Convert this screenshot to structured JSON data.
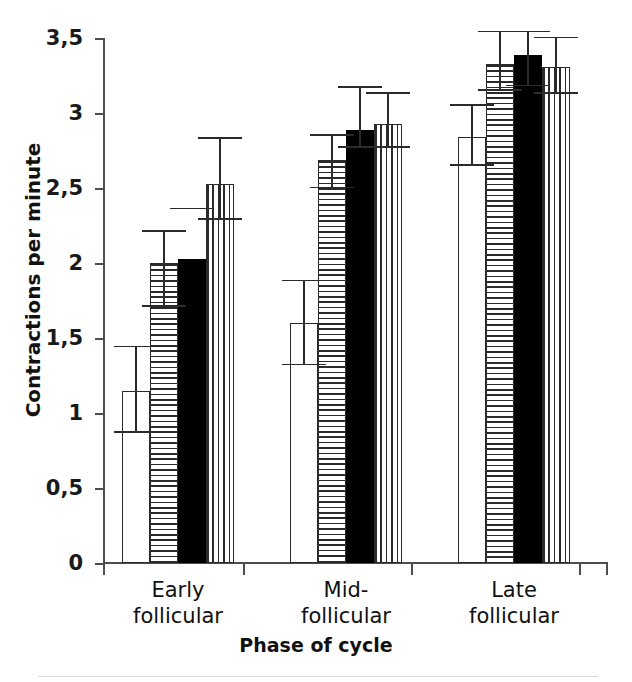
{
  "chart_data": {
    "type": "bar",
    "title": "",
    "xlabel": "Phase of cycle",
    "ylabel": "Contractions per minute",
    "ylim": [
      0,
      3.5
    ],
    "ytick_labels": [
      "0",
      "0,5",
      "1",
      "1,5",
      "2",
      "2,5",
      "3",
      "3,5"
    ],
    "ytick_values": [
      0,
      0.5,
      1,
      1.5,
      2,
      2.5,
      3,
      3.5
    ],
    "grid": false,
    "legend_position": "none",
    "decimal_separator": ",",
    "categories": [
      "Early follicular",
      "Mid- follicular",
      "Late follicular"
    ],
    "category_lines": [
      [
        "Early",
        "follicular"
      ],
      [
        "Mid-",
        "follicular"
      ],
      [
        "Late",
        "follicular"
      ]
    ],
    "series": [
      {
        "name": "bar-1",
        "pattern": "none",
        "values": [
          1.15,
          1.6,
          2.84
        ],
        "err_low": [
          0.88,
          1.33,
          2.66
        ],
        "err_high": [
          1.45,
          1.89,
          3.06
        ]
      },
      {
        "name": "bar-2",
        "pattern": "horizontal-stripes",
        "values": [
          2.0,
          2.69,
          3.33
        ],
        "err_low": [
          1.72,
          2.51,
          3.16
        ],
        "err_high": [
          2.22,
          2.86,
          3.55
        ]
      },
      {
        "name": "bar-3",
        "pattern": "solid-black",
        "values": [
          2.03,
          2.89,
          3.39
        ],
        "err_low": [
          2.37,
          2.78,
          3.19
        ],
        "err_high": [
          2.37,
          3.18,
          3.55
        ]
      },
      {
        "name": "bar-4",
        "pattern": "vertical-stripes",
        "values": [
          2.53,
          2.93,
          3.31
        ],
        "err_low": [
          2.3,
          2.78,
          3.14
        ],
        "err_high": [
          2.84,
          3.14,
          3.51
        ]
      }
    ]
  },
  "axis": {
    "y_title": "Contractions per minute",
    "x_title": "Phase of cycle"
  }
}
